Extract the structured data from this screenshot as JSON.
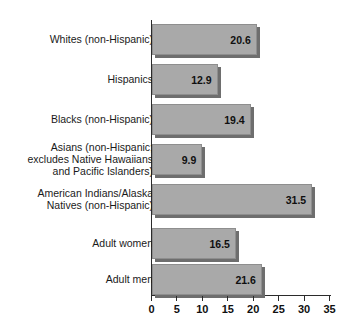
{
  "chart_data": {
    "type": "bar",
    "orientation": "horizontal",
    "title": "",
    "subtitle": "",
    "xlabel": "",
    "ylabel": "",
    "xlim": [
      0,
      35
    ],
    "xticks": [
      0,
      5,
      10,
      15,
      20,
      25,
      30,
      35
    ],
    "xtick_labels": [
      "0",
      "5",
      "10",
      "15",
      "20",
      "25",
      "30",
      "35"
    ],
    "grid": false,
    "legend": "none",
    "bar_color": "#a9a9a9",
    "bar_edge_color": "#8e8e8e",
    "bar_shadow_color": "#6e6e6e",
    "axis_color": "#2b2b2b",
    "value_labels_shown": true,
    "categories": [
      "Whites (non-Hispanic)",
      "Hispanics",
      "Blacks (non-Hispanic)",
      "Asians (non-Hispanic;\nexcludes Native Hawaiians\nand Pacific Islanders)",
      "American Indians/Alaska\nNatives (non-Hispanic)",
      "Adult women",
      "Adult men"
    ],
    "values": [
      20.6,
      12.9,
      19.4,
      9.9,
      31.5,
      16.5,
      21.6
    ],
    "value_labels": [
      "20.6",
      "12.9",
      "19.4",
      "9.9",
      "31.5",
      "16.5",
      "21.6"
    ],
    "group_break_after_index": 4
  },
  "bars": [
    {
      "label": "Whites (non-Hispanic)",
      "value": 20.6,
      "value_label": "20.6",
      "top": 24,
      "height": 31
    },
    {
      "label": "Hispanics",
      "value": 12.9,
      "value_label": "12.9",
      "top": 64,
      "height": 31
    },
    {
      "label": "Blacks (non-Hispanic)",
      "value": 19.4,
      "value_label": "19.4",
      "top": 104,
      "height": 31
    },
    {
      "label": "Asians (non-Hispanic;\nexcludes Native Hawaiians\nand Pacific Islanders)",
      "value": 9.9,
      "value_label": "9.9",
      "top": 144,
      "height": 31
    },
    {
      "label": "American Indians/Alaska\nNatives (non-Hispanic)",
      "value": 31.5,
      "value_label": "31.5",
      "top": 184,
      "height": 31
    },
    {
      "label": "Adult women",
      "value": 16.5,
      "value_label": "16.5",
      "top": 228,
      "height": 31
    },
    {
      "label": "Adult men",
      "value": 21.6,
      "value_label": "21.6",
      "top": 264,
      "height": 31
    }
  ],
  "axis": {
    "ticks": [
      {
        "value": 0,
        "label": "0"
      },
      {
        "value": 5,
        "label": "5"
      },
      {
        "value": 10,
        "label": "10"
      },
      {
        "value": 15,
        "label": "15"
      },
      {
        "value": 20,
        "label": "20"
      },
      {
        "value": 25,
        "label": "25"
      },
      {
        "value": 30,
        "label": "30"
      },
      {
        "value": 35,
        "label": "35"
      }
    ]
  }
}
